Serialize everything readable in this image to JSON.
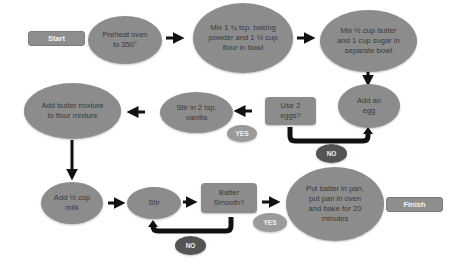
{
  "diagram": {
    "type": "flowchart",
    "colors": {
      "node_fill": "#8c8c8c",
      "node_text": "#3a3a3a",
      "terminal_text": "#f2f2f2",
      "yes_fill": "#9a9a9a",
      "no_fill": "#545454",
      "arrow": "#111111"
    },
    "nodes": {
      "start": "Start",
      "preheat": "Preheat oven to 350°",
      "mix_flour": "Mix 1 ¾ tsp. baking powder and 1 ½ cup flour in bowl",
      "mix_butter": "Mix ½ cup butter and 1 cup sugar in separate bowl",
      "add_egg": "Add an egg",
      "use_two_eggs": "Use 2 eggs?",
      "stir_vanilla": "Stir in 2 tsp. vanilla",
      "add_butter_mixture": "Add butter mixture to flour mixture",
      "add_milk": "Add ½ cup milk",
      "stir": "Stir",
      "batter_smooth": "Batter Smooth?",
      "bake": "Put batter in pan, put pan in oven and bake for 20 minutes",
      "finish": "Finish"
    },
    "branch_labels": {
      "eggs_yes": "YES",
      "eggs_no": "NO",
      "smooth_yes": "YES",
      "smooth_no": "NO"
    },
    "edges": [
      {
        "from": "start",
        "to": "preheat"
      },
      {
        "from": "preheat",
        "to": "mix_flour"
      },
      {
        "from": "mix_flour",
        "to": "mix_butter"
      },
      {
        "from": "mix_butter",
        "to": "add_egg"
      },
      {
        "from": "use_two_eggs",
        "to": "stir_vanilla",
        "label": "YES"
      },
      {
        "from": "use_two_eggs",
        "to": "add_egg",
        "label": "NO"
      },
      {
        "from": "stir_vanilla",
        "to": "add_butter_mixture"
      },
      {
        "from": "add_butter_mixture",
        "to": "add_milk"
      },
      {
        "from": "add_milk",
        "to": "stir"
      },
      {
        "from": "stir",
        "to": "batter_smooth"
      },
      {
        "from": "batter_smooth",
        "to": "stir",
        "label": "NO"
      },
      {
        "from": "batter_smooth",
        "to": "bake",
        "label": "YES"
      }
    ]
  }
}
